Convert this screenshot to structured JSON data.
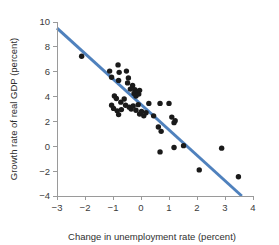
{
  "chart_data": {
    "type": "scatter",
    "title": "",
    "xlabel": "Change in unemployment rate (percent)",
    "ylabel": "Growth rate of real GDP (percent)",
    "xlim": [
      -3,
      4
    ],
    "ylim": [
      -4,
      10
    ],
    "xticks": [
      -3,
      -2,
      -1,
      0,
      1,
      2,
      3,
      4
    ],
    "xtick_labels": [
      "−3",
      "−2",
      "−1",
      "0",
      "1",
      "2",
      "3",
      "4"
    ],
    "yticks": [
      -4,
      -2,
      0,
      2,
      4,
      6,
      8,
      10
    ],
    "ytick_labels": [
      "−4",
      "−2",
      "0",
      "2",
      "4",
      "6",
      "8",
      "10"
    ],
    "grid": false,
    "legend": "none",
    "point_color": "#1a1a1a",
    "trendline_color": "#4f81bd",
    "axis_color": "#9a9a9a",
    "points": [
      {
        "x": -2.12,
        "y": 7.25
      },
      {
        "x": -1.12,
        "y": 6.05
      },
      {
        "x": -1.05,
        "y": 5.55
      },
      {
        "x": -0.82,
        "y": 6.55
      },
      {
        "x": -0.78,
        "y": 5.95
      },
      {
        "x": -0.8,
        "y": 5.3
      },
      {
        "x": -0.52,
        "y": 6.05
      },
      {
        "x": -0.45,
        "y": 5.5
      },
      {
        "x": -0.48,
        "y": 5.1
      },
      {
        "x": -0.3,
        "y": 4.9
      },
      {
        "x": -0.38,
        "y": 4.6
      },
      {
        "x": -0.22,
        "y": 4.55
      },
      {
        "x": -0.25,
        "y": 4.25
      },
      {
        "x": -0.18,
        "y": 4.05
      },
      {
        "x": -0.12,
        "y": 4.4
      },
      {
        "x": -0.08,
        "y": 4.2
      },
      {
        "x": -0.05,
        "y": 4.5
      },
      {
        "x": -0.95,
        "y": 4.05
      },
      {
        "x": -0.88,
        "y": 3.85
      },
      {
        "x": -0.72,
        "y": 3.55
      },
      {
        "x": -0.6,
        "y": 3.8
      },
      {
        "x": -1.05,
        "y": 3.3
      },
      {
        "x": -0.98,
        "y": 3.05
      },
      {
        "x": -0.85,
        "y": 2.85
      },
      {
        "x": -0.8,
        "y": 2.55
      },
      {
        "x": -0.7,
        "y": 2.95
      },
      {
        "x": -0.55,
        "y": 3.3
      },
      {
        "x": -0.42,
        "y": 3.15
      },
      {
        "x": -0.35,
        "y": 3.0
      },
      {
        "x": -0.28,
        "y": 3.25
      },
      {
        "x": -0.18,
        "y": 2.9
      },
      {
        "x": -0.1,
        "y": 3.35
      },
      {
        "x": -0.05,
        "y": 2.6
      },
      {
        "x": 0.02,
        "y": 2.8
      },
      {
        "x": 0.1,
        "y": 2.45
      },
      {
        "x": 0.18,
        "y": 2.7
      },
      {
        "x": 0.28,
        "y": 3.45
      },
      {
        "x": 0.45,
        "y": 2.45
      },
      {
        "x": 0.68,
        "y": 3.45
      },
      {
        "x": 1.0,
        "y": 3.45
      },
      {
        "x": 0.62,
        "y": 1.55
      },
      {
        "x": 0.72,
        "y": 1.2
      },
      {
        "x": 1.1,
        "y": 2.35
      },
      {
        "x": 1.18,
        "y": 1.9
      },
      {
        "x": 1.22,
        "y": 2.05
      },
      {
        "x": 0.68,
        "y": -0.45
      },
      {
        "x": 1.18,
        "y": -0.1
      },
      {
        "x": 1.52,
        "y": 0.05
      },
      {
        "x": 2.88,
        "y": -0.15
      },
      {
        "x": 2.08,
        "y": -1.9
      },
      {
        "x": 3.48,
        "y": -2.45
      }
    ],
    "trendline": {
      "x_start": -3.0,
      "y_start": 9.5,
      "x_end": 3.6,
      "y_end": -4.0
    }
  }
}
